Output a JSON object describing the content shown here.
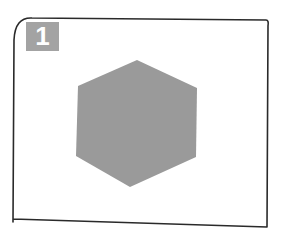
{
  "figure": {
    "badge": {
      "label": "1",
      "color": "#a3a3a3",
      "text_color": "#ffffff"
    },
    "frame": {
      "stroke_color": "#2a2a2a",
      "style": "hand-drawn rectangle"
    },
    "shape": {
      "type": "hexagon",
      "fill_color": "#9a9a9a"
    }
  }
}
